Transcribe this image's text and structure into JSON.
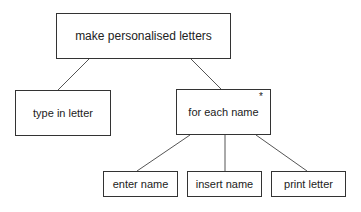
{
  "diagram": {
    "type": "structure-chart",
    "nodes": [
      {
        "id": "root",
        "label": "make personalised letters"
      },
      {
        "id": "type",
        "label": "type in letter"
      },
      {
        "id": "loop",
        "label": "for each name",
        "iteration_marker": "*"
      },
      {
        "id": "enter",
        "label": "enter name"
      },
      {
        "id": "insert",
        "label": "insert name"
      },
      {
        "id": "print",
        "label": "print letter"
      }
    ],
    "edges": [
      {
        "from": "root",
        "to": "type"
      },
      {
        "from": "root",
        "to": "loop"
      },
      {
        "from": "loop",
        "to": "enter"
      },
      {
        "from": "loop",
        "to": "insert"
      },
      {
        "from": "loop",
        "to": "print"
      }
    ],
    "colors": {
      "line": "#333333",
      "text": "#222222",
      "background": "#ffffff"
    }
  }
}
